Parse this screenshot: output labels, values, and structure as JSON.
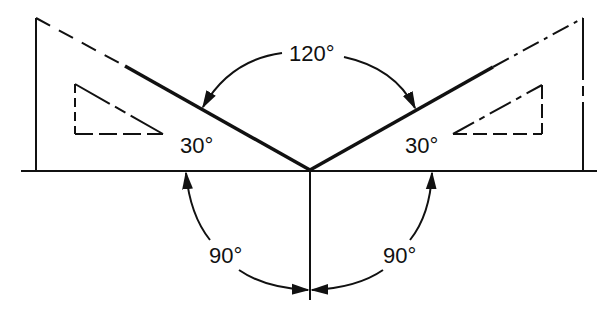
{
  "diagram": {
    "title": "",
    "labels": {
      "top_angle": "120°",
      "left_triangle_angle": "30°",
      "right_triangle_angle": "30°",
      "bottom_left_angle": "90°",
      "bottom_right_angle": "90°"
    },
    "colors": {
      "line": "#111111",
      "background": "#ffffff"
    }
  }
}
